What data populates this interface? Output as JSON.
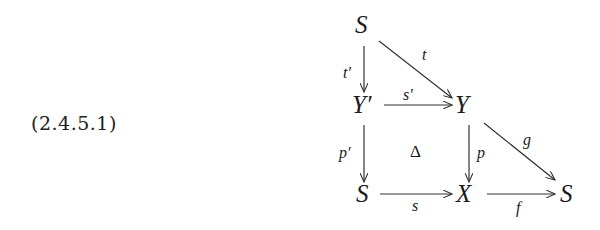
{
  "equation_label": "(2.4.5.1)",
  "diagram": {
    "nodes": {
      "top_s": "S",
      "y_prime": "Y′",
      "y": "Y",
      "bottom_left_s": "S",
      "x": "X",
      "bottom_right_s": "S"
    },
    "arrows": {
      "t": "t",
      "t_prime": "t′",
      "s_prime": "s′",
      "p_prime": "p′",
      "p": "p",
      "g": "g",
      "s": "s",
      "f": "f"
    },
    "center_symbol": "Δ"
  }
}
